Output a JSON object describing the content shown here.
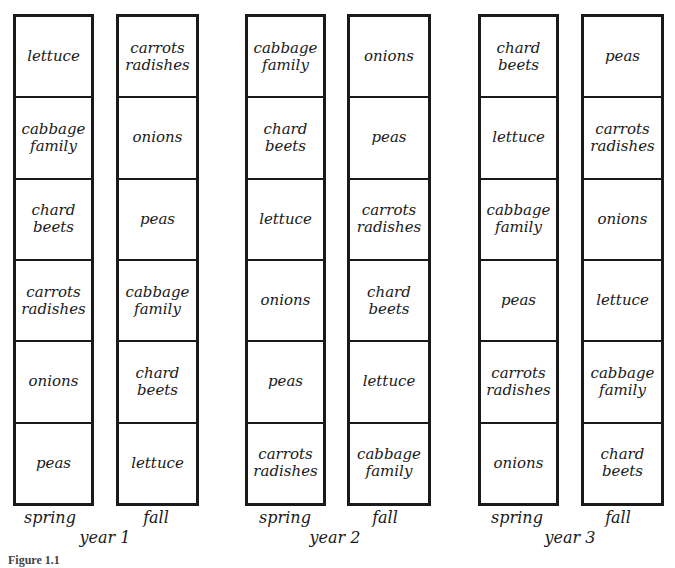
{
  "diagram": {
    "years": [
      {
        "label": "year 1",
        "seasons": [
          {
            "label": "spring",
            "beds": [
              "lettuce",
              "cabbage\nfamily",
              "chard\nbeets",
              "carrots\nradishes",
              "onions",
              "peas"
            ]
          },
          {
            "label": "fall",
            "beds": [
              "carrots\nradishes",
              "onions",
              "peas",
              "cabbage\nfamily",
              "chard\nbeets",
              "lettuce"
            ]
          }
        ]
      },
      {
        "label": "year 2",
        "seasons": [
          {
            "label": "spring",
            "beds": [
              "cabbage\nfamily",
              "chard\nbeets",
              "lettuce",
              "onions",
              "peas",
              "carrots\nradishes"
            ]
          },
          {
            "label": "fall",
            "beds": [
              "onions",
              "peas",
              "carrots\nradishes",
              "chard\nbeets",
              "lettuce",
              "cabbage\nfamily"
            ]
          }
        ]
      },
      {
        "label": "year 3",
        "seasons": [
          {
            "label": "spring",
            "beds": [
              "chard\nbeets",
              "lettuce",
              "cabbage\nfamily",
              "peas",
              "carrots\nradishes",
              "onions"
            ]
          },
          {
            "label": "fall",
            "beds": [
              "peas",
              "carrots\nradishes",
              "onions",
              "lettuce",
              "cabbage\nfamily",
              "chard\nbeets"
            ]
          }
        ]
      }
    ],
    "caption": "Figure 1.1"
  },
  "colors": {
    "line": "#1a1a1a",
    "background": "#ffffff"
  }
}
